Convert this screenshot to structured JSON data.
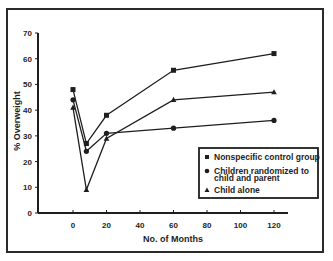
{
  "chart_data": {
    "type": "line",
    "title": "",
    "xlabel": "No. of Months",
    "ylabel": "% Overweight",
    "xlim": [
      -15,
      140
    ],
    "ylim": [
      0,
      70
    ],
    "x_ticks": [
      0,
      20,
      40,
      60,
      80,
      100,
      120
    ],
    "y_ticks": [
      0,
      10,
      20,
      30,
      40,
      50,
      60,
      70
    ],
    "grid": false,
    "legend_position": "lower right",
    "x": [
      0,
      8,
      20,
      60,
      120
    ],
    "series": [
      {
        "name": "Nonspecific control group",
        "marker": "square",
        "values": [
          48,
          27,
          38,
          55.5,
          62
        ]
      },
      {
        "name": "Children randomized to child and parent",
        "marker": "circle",
        "values": [
          44,
          24,
          31,
          33,
          36
        ]
      },
      {
        "name": "Child alone",
        "marker": "triangle",
        "values": [
          41,
          9,
          29,
          44,
          47
        ]
      }
    ]
  },
  "labels": {
    "xlabel": "No. of Months",
    "ylabel": "% Overweight",
    "x_ticks": [
      "0",
      "20",
      "40",
      "60",
      "80",
      "100",
      "120"
    ],
    "y_ticks": [
      "0",
      "10",
      "20",
      "30",
      "40",
      "50",
      "60",
      "70"
    ],
    "legend": [
      {
        "line1": "Nonspecific control group",
        "line2": ""
      },
      {
        "line1": "Children randomized to",
        "line2": "child and parent"
      },
      {
        "line1": "Child alone",
        "line2": ""
      }
    ]
  },
  "colors": {
    "ink": "#1e1e1e",
    "background": "#ffffff"
  }
}
